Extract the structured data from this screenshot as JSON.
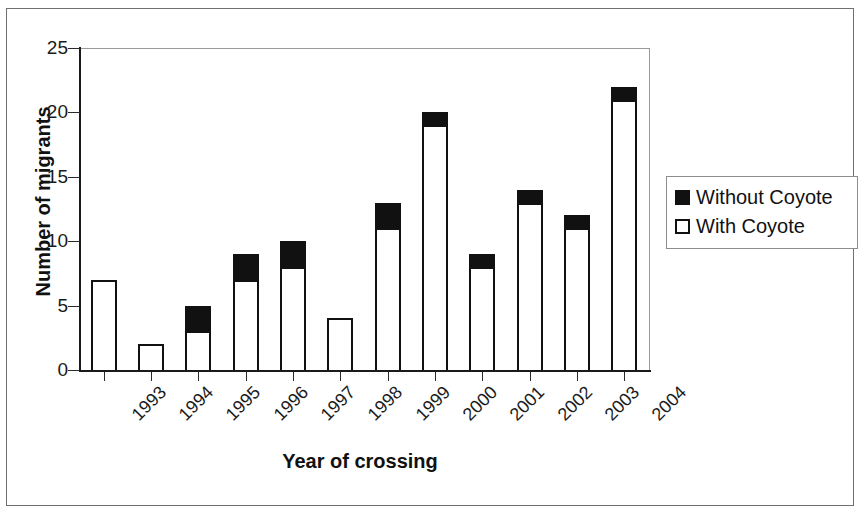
{
  "chart_data": {
    "type": "bar",
    "subtype": "stacked-vertical",
    "title": "",
    "xlabel": "Year of crossing",
    "ylabel": "Number of migrants",
    "categories": [
      "1993",
      "1994",
      "1995",
      "1996",
      "1997",
      "1998",
      "1999",
      "2000",
      "2001",
      "2002",
      "2003",
      "2004"
    ],
    "series": [
      {
        "name": "With Coyote",
        "values": [
          7,
          2,
          3,
          7,
          8,
          4,
          11,
          19,
          8,
          13,
          11,
          21
        ],
        "color": "#ffffff"
      },
      {
        "name": "Without Coyote",
        "values": [
          0,
          0,
          2,
          2,
          2,
          0,
          2,
          1,
          1,
          1,
          1,
          1
        ],
        "color": "#111111"
      }
    ],
    "totals": [
      7,
      2,
      5,
      9,
      10,
      4,
      13,
      20,
      9,
      14,
      12,
      22
    ],
    "ylim": [
      0,
      25
    ],
    "yticks": [
      0,
      5,
      10,
      15,
      20,
      25
    ],
    "ytick_labels": [
      "0",
      "5",
      "10",
      "15",
      "20",
      "25"
    ],
    "grid": false,
    "legend_position": "right",
    "xtick_label_rotation": -45
  },
  "legend": {
    "entries": [
      {
        "label": "Without Coyote",
        "swatch": "filled-square-icon"
      },
      {
        "label": "With Coyote",
        "swatch": "open-square-icon"
      }
    ]
  },
  "axes": {
    "y_title": "Number of migrants",
    "x_title": "Year of crossing"
  }
}
